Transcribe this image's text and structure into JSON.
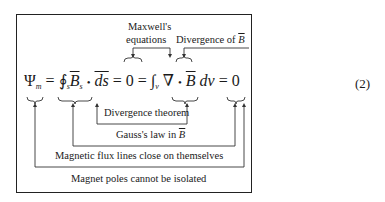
{
  "equation": {
    "number": "(2)",
    "psi": "Ψ",
    "psi_sub": "m",
    "eq1": "=",
    "oint": "∮",
    "oint_sub": "s",
    "B": "B",
    "B_sub": "s",
    "dot1": "•",
    "ds": "ds",
    "eq2": "=",
    "zero1": "0",
    "eq3": "=",
    "int": "∫",
    "int_sub": "v",
    "nabla": "∇",
    "dot2": "•",
    "B2": "B",
    "dv": "dv",
    "eq4": "=",
    "zero2": "0"
  },
  "annotations": {
    "maxwell_line1": "Maxwell's",
    "maxwell_line2": "equations",
    "divergence_of": "Divergence of",
    "divergence_of_B": "B",
    "divergence_theorem": "Divergence theorem",
    "gauss_law": "Gauss's law in",
    "gauss_law_B": "B",
    "flux_lines": "Magnetic flux lines close on themselves",
    "poles": "Magnet poles cannot be isolated"
  }
}
